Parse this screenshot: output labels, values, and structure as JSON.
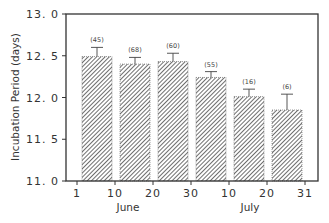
{
  "chart_data": {
    "type": "bar",
    "title": "",
    "xlabel": "",
    "ylabel": "Incubation Period (days)",
    "ylim": [
      11.0,
      13.0
    ],
    "yticks": [
      11.0,
      11.5,
      12.0,
      12.5,
      13.0
    ],
    "ytick_labels": [
      "11. 0",
      "11. 5",
      "12. 0",
      "12. 5",
      "13. 0"
    ],
    "xtick_labels": [
      "1",
      "10",
      "20",
      "30",
      "10",
      "20",
      "31"
    ],
    "month_labels": [
      "June",
      "July"
    ],
    "grid": false,
    "legend": null,
    "bar_fill": "diagonal hatch",
    "categories": [
      "Jun 1-10",
      "Jun 10-20",
      "Jun 20-30",
      "Jun 30-Jul 10",
      "Jul 10-20",
      "Jul 20-31"
    ],
    "values": [
      12.49,
      12.4,
      12.43,
      12.24,
      12.01,
      11.85
    ],
    "error_upper": [
      0.11,
      0.08,
      0.1,
      0.07,
      0.09,
      0.19
    ],
    "sample_sizes": [
      "(45)",
      "(68)",
      "(60)",
      "(55)",
      "(16)",
      "(6)"
    ]
  },
  "colors": {
    "axis": "#333333",
    "bar_hatch": "#555555",
    "background": "#ffffff"
  }
}
